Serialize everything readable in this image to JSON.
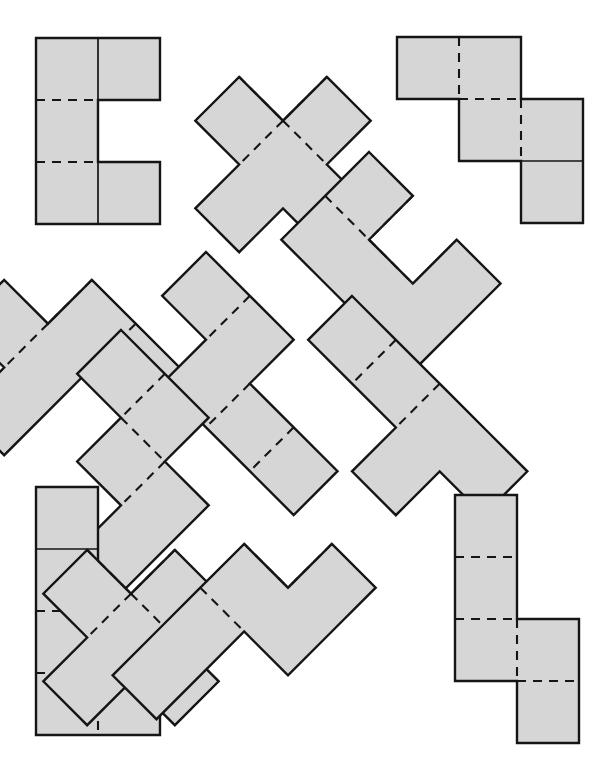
{
  "figure": {
    "canvas": {
      "width": 609,
      "height": 776,
      "background": "#ffffff"
    },
    "style": {
      "fill": "#d6d6d6",
      "outline_color": "#151515",
      "outline_width": 2.4,
      "fold_color": "#151515",
      "fold_width": 2.1,
      "fold_dash": "9 7"
    },
    "cell_size": 62,
    "piece_count": 12,
    "pieces": [
      {
        "id": "piece-1",
        "name": "c-hexomino-upright",
        "label": "C",
        "rotation_deg": 0,
        "origin": {
          "x": 36,
          "y": 38
        },
        "cells": [
          [
            0,
            0
          ],
          [
            1,
            0
          ],
          [
            0,
            1
          ],
          [
            0,
            2
          ],
          [
            1,
            2
          ]
        ],
        "folds": [
          {
            "type": "dashed",
            "from": [
              0,
              1
            ],
            "to": [
              1,
              1
            ]
          },
          {
            "type": "dashed",
            "from": [
              0,
              2
            ],
            "to": [
              1,
              2
            ]
          },
          {
            "type": "solid",
            "from": [
              1,
              0
            ],
            "to": [
              1,
              1
            ]
          },
          {
            "type": "solid",
            "from": [
              1,
              2
            ],
            "to": [
              1,
              3
            ]
          }
        ]
      },
      {
        "id": "piece-2",
        "name": "x-pentomino-rotated",
        "label": "X",
        "rotation_deg": 45,
        "origin": {
          "x": 283,
          "y": 33
        },
        "cells": [
          [
            1,
            0
          ],
          [
            0,
            1
          ],
          [
            1,
            1
          ],
          [
            2,
            1
          ],
          [
            1,
            2
          ]
        ],
        "folds": [
          {
            "type": "dashed",
            "from": [
              1,
              1
            ],
            "to": [
              2,
              1
            ]
          },
          {
            "type": "dashed",
            "from": [
              1,
              1
            ],
            "to": [
              1,
              2
            ]
          },
          {
            "type": "dashed",
            "from": [
              0,
              1
            ],
            "to": [
              1,
              1
            ]
          },
          {
            "type": "dashed",
            "from": [
              1,
              0
            ],
            "to": [
              1,
              1
            ]
          }
        ]
      },
      {
        "id": "piece-3",
        "name": "w-pentomino-staircase",
        "label": "W",
        "rotation_deg": 0,
        "origin": {
          "x": 397,
          "y": 37
        },
        "cells": [
          [
            0,
            0
          ],
          [
            1,
            0
          ],
          [
            1,
            1
          ],
          [
            2,
            1
          ],
          [
            2,
            2
          ]
        ],
        "folds": [
          {
            "type": "dashed",
            "from": [
              1,
              0
            ],
            "to": [
              1,
              1
            ]
          },
          {
            "type": "dashed",
            "from": [
              1,
              1
            ],
            "to": [
              2,
              1
            ]
          },
          {
            "type": "dashed",
            "from": [
              2,
              1
            ],
            "to": [
              2,
              2
            ]
          },
          {
            "type": "solid",
            "from": [
              2,
              2
            ],
            "to": [
              3,
              2
            ]
          }
        ]
      },
      {
        "id": "piece-4",
        "name": "z-pentomino-rotated-left",
        "label": "Z",
        "rotation_deg": 45,
        "origin": {
          "x": 48,
          "y": 236
        },
        "cells": [
          [
            1,
            0
          ],
          [
            2,
            0
          ],
          [
            0,
            1
          ],
          [
            1,
            1
          ],
          [
            1,
            2
          ]
        ],
        "folds": [
          {
            "type": "dashed",
            "from": [
              1,
              0
            ],
            "to": [
              1,
              1
            ]
          },
          {
            "type": "dashed",
            "from": [
              1,
              1
            ],
            "to": [
              1,
              2
            ]
          },
          {
            "type": "dashed",
            "from": [
              2,
              0
            ],
            "to": [
              2,
              1
            ]
          }
        ]
      },
      {
        "id": "piece-5",
        "name": "n-pentomino-rotated-center",
        "label": "N",
        "rotation_deg": 45,
        "origin": {
          "x": 206,
          "y": 252
        },
        "cells": [
          [
            0,
            0
          ],
          [
            1,
            0
          ],
          [
            1,
            1
          ],
          [
            2,
            1
          ],
          [
            3,
            1
          ]
        ],
        "folds": [
          {
            "type": "dashed",
            "from": [
              1,
              0
            ],
            "to": [
              1,
              1
            ]
          },
          {
            "type": "dashed",
            "from": [
              2,
              1
            ],
            "to": [
              2,
              2
            ]
          },
          {
            "type": "dashed",
            "from": [
              3,
              1
            ],
            "to": [
              3,
              2
            ]
          }
        ]
      },
      {
        "id": "piece-6",
        "name": "l-pentomino-rotated-upper-right",
        "label": "L",
        "rotation_deg": 45,
        "origin": {
          "x": 369,
          "y": 152
        },
        "cells": [
          [
            0,
            0
          ],
          [
            0,
            1
          ],
          [
            1,
            1
          ],
          [
            2,
            1
          ],
          [
            2,
            0
          ]
        ],
        "folds": [
          {
            "type": "dashed",
            "from": [
              0,
              1
            ],
            "to": [
              1,
              1
            ]
          },
          {
            "type": "dashed",
            "from": [
              1,
              1
            ],
            "to": [
              2,
              1
            ]
          },
          {
            "type": "dashed",
            "from": [
              1,
              0
            ],
            "to": [
              1,
              1
            ]
          },
          {
            "type": "solid",
            "from": [
              2,
              0
            ],
            "to": [
              2,
              1
            ]
          }
        ]
      },
      {
        "id": "piece-7",
        "name": "y-pentomino-rotated-right",
        "label": "Y",
        "rotation_deg": 45,
        "origin": {
          "x": 352,
          "y": 296
        },
        "cells": [
          [
            0,
            0
          ],
          [
            1,
            0
          ],
          [
            2,
            0
          ],
          [
            2,
            1
          ],
          [
            3,
            0
          ]
        ],
        "folds": [
          {
            "type": "dashed",
            "from": [
              1,
              0
            ],
            "to": [
              1,
              1
            ]
          },
          {
            "type": "dashed",
            "from": [
              2,
              0
            ],
            "to": [
              2,
              1
            ]
          },
          {
            "type": "solid",
            "from": [
              2,
              0
            ],
            "to": [
              3,
              0
            ]
          }
        ]
      },
      {
        "id": "piece-8",
        "name": "s-pentomino-rotated-left-lower",
        "label": "S",
        "rotation_deg": 45,
        "origin": {
          "x": 121,
          "y": 330
        },
        "cells": [
          [
            0,
            0
          ],
          [
            1,
            0
          ],
          [
            1,
            1
          ],
          [
            2,
            1
          ],
          [
            2,
            2
          ]
        ],
        "folds": [
          {
            "type": "dashed",
            "from": [
              1,
              0
            ],
            "to": [
              1,
              1
            ]
          },
          {
            "type": "dashed",
            "from": [
              1,
              1
            ],
            "to": [
              2,
              1
            ]
          },
          {
            "type": "dashed",
            "from": [
              2,
              1
            ],
            "to": [
              2,
              2
            ]
          }
        ]
      },
      {
        "id": "piece-9",
        "name": "l-pentomino-upright-bottom-left",
        "label": "L",
        "rotation_deg": 0,
        "origin": {
          "x": 36,
          "y": 487
        },
        "cells": [
          [
            0,
            0
          ],
          [
            0,
            1
          ],
          [
            0,
            2
          ],
          [
            0,
            3
          ],
          [
            1,
            3
          ]
        ],
        "folds": [
          {
            "type": "solid",
            "from": [
              0,
              1
            ],
            "to": [
              1,
              1
            ]
          },
          {
            "type": "dashed",
            "from": [
              0,
              2
            ],
            "to": [
              1,
              2
            ]
          },
          {
            "type": "dashed",
            "from": [
              0,
              3
            ],
            "to": [
              1,
              3
            ]
          },
          {
            "type": "dashed",
            "from": [
              1,
              3
            ],
            "to": [
              1,
              4
            ]
          }
        ]
      },
      {
        "id": "piece-10",
        "name": "x-pentomino-rotated-bottom-center",
        "label": "X",
        "rotation_deg": 45,
        "origin": {
          "x": 131,
          "y": 506
        },
        "cells": [
          [
            1,
            0
          ],
          [
            0,
            1
          ],
          [
            1,
            1
          ],
          [
            2,
            1
          ],
          [
            1,
            2
          ]
        ],
        "folds": [
          {
            "type": "dashed",
            "from": [
              0,
              1
            ],
            "to": [
              1,
              1
            ]
          },
          {
            "type": "dashed",
            "from": [
              1,
              0
            ],
            "to": [
              1,
              1
            ]
          },
          {
            "type": "dashed",
            "from": [
              1,
              1
            ],
            "to": [
              2,
              1
            ]
          },
          {
            "type": "dashed",
            "from": [
              1,
              1
            ],
            "to": [
              1,
              2
            ]
          }
        ]
      },
      {
        "id": "piece-11",
        "name": "n-pentomino-rotated-bottom-center-right",
        "label": "N",
        "rotation_deg": 45,
        "origin": {
          "x": 288,
          "y": 500
        },
        "cells": [
          [
            1,
            0
          ],
          [
            1,
            1
          ],
          [
            0,
            1
          ],
          [
            0,
            2
          ],
          [
            0,
            3
          ]
        ],
        "folds": [
          {
            "type": "dashed",
            "from": [
              1,
              0
            ],
            "to": [
              1,
              1
            ]
          },
          {
            "type": "dashed",
            "from": [
              0,
              1
            ],
            "to": [
              1,
              1
            ]
          },
          {
            "type": "dashed",
            "from": [
              0,
              2
            ],
            "to": [
              1,
              2
            ]
          }
        ]
      },
      {
        "id": "piece-12",
        "name": "s-pentomino-upright-bottom-right",
        "label": "S",
        "rotation_deg": 0,
        "origin": {
          "x": 455,
          "y": 495
        },
        "cells": [
          [
            0,
            0
          ],
          [
            0,
            1
          ],
          [
            0,
            2
          ],
          [
            1,
            2
          ],
          [
            1,
            3
          ]
        ],
        "folds": [
          {
            "type": "dashed",
            "from": [
              0,
              1
            ],
            "to": [
              1,
              1
            ]
          },
          {
            "type": "dashed",
            "from": [
              0,
              2
            ],
            "to": [
              1,
              2
            ]
          },
          {
            "type": "dashed",
            "from": [
              1,
              2
            ],
            "to": [
              1,
              3
            ]
          },
          {
            "type": "dashed",
            "from": [
              1,
              3
            ],
            "to": [
              2,
              3
            ]
          }
        ]
      }
    ]
  }
}
